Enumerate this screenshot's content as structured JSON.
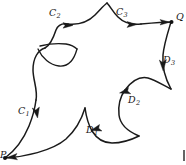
{
  "figure": {
    "type": "oriented-closed-curve-diagram",
    "stroke_color": "#1a1a1a",
    "background_color": "#ffffff",
    "width": 186,
    "height": 165,
    "nodes": [
      {
        "id": "P",
        "label": "P",
        "x": 4,
        "y": 158
      },
      {
        "id": "Q",
        "label": "Q",
        "x": 172,
        "y": 22
      }
    ],
    "node_labels": [
      {
        "id": "label-P",
        "text": "P",
        "x": 0,
        "y": 152
      },
      {
        "id": "label-Q",
        "text": "Q",
        "x": 176,
        "y": 12
      }
    ],
    "arc_labels": [
      {
        "id": "C1",
        "base": "C",
        "sub": "1",
        "x": 18,
        "y": 108
      },
      {
        "id": "C2",
        "base": "C",
        "sub": "2",
        "x": 49,
        "y": 10
      },
      {
        "id": "C3",
        "base": "C",
        "sub": "3",
        "x": 116,
        "y": 9
      },
      {
        "id": "D1",
        "base": "D",
        "sub": "1",
        "x": 86,
        "y": 127
      },
      {
        "id": "D2",
        "base": "D",
        "sub": "2",
        "x": 128,
        "y": 97
      },
      {
        "id": "D3",
        "base": "D",
        "sub": "3",
        "x": 163,
        "y": 57
      }
    ],
    "arrows": [
      {
        "id": "arrow-C1",
        "on": "C1",
        "direction": "down"
      },
      {
        "id": "arrow-C2",
        "on": "C2",
        "direction": "right"
      },
      {
        "id": "arrow-C3",
        "on": "C3",
        "direction": "right"
      },
      {
        "id": "arrow-Q",
        "on": "C3",
        "direction": "right-into-Q"
      },
      {
        "id": "arrow-D3",
        "on": "D3",
        "direction": "down"
      },
      {
        "id": "arrow-D2",
        "on": "D2",
        "direction": "up-left"
      },
      {
        "id": "arrow-D1",
        "on": "D1",
        "direction": "up-left"
      },
      {
        "id": "arrow-P",
        "on": "D1",
        "direction": "left-into-P"
      }
    ],
    "page_mark": {
      "id": "page-edge-mark",
      "visible": true
    }
  }
}
